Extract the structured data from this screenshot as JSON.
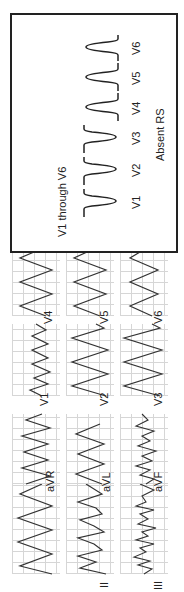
{
  "ecg": {
    "columns": [
      {
        "leads": [
          "I",
          "II",
          "III"
        ]
      },
      {
        "leads": [
          "aVR",
          "aVL",
          "aVF"
        ]
      },
      {
        "leads": [
          "V1",
          "V2",
          "V3"
        ]
      },
      {
        "leads": [
          "V4",
          "V5",
          "V6"
        ]
      }
    ],
    "labels": {
      "I": "",
      "II": "II",
      "III": "III",
      "aVR": "aVR",
      "aVL": "aVL",
      "aVF": "aVF",
      "V1": "V1",
      "V2": "V2",
      "V3": "V3",
      "V4": "V4",
      "V5": "V5",
      "V6": "V6"
    },
    "grid_color": "#d6d6d6",
    "trace_color": "#333333"
  },
  "schematic": {
    "title": "V1 through V6",
    "caption": "Absent RS",
    "leads": [
      "V1",
      "V2",
      "V3",
      "V4",
      "V5",
      "V6"
    ],
    "complex_polarity": [
      "negative",
      "negative",
      "negative",
      "positive",
      "positive",
      "positive"
    ],
    "border_color": "#222222"
  }
}
